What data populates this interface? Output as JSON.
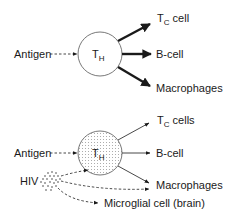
{
  "diagrams": [
    {
      "name": "normal",
      "center_label": "T",
      "center_sub": "H",
      "input_label": "Antigen",
      "outputs": [
        {
          "main": "T",
          "sub": "C",
          "rest": " cell"
        },
        {
          "main": "B-cell"
        },
        {
          "main": "Macrophages"
        }
      ]
    },
    {
      "name": "hiv-infected",
      "center_label": "T",
      "center_sub": "H",
      "input_label": "Antigen",
      "virus_label": "HIV",
      "outputs": [
        {
          "main": "T",
          "sub": "C",
          "rest": " cells"
        },
        {
          "main": "B-cell"
        },
        {
          "main": "Macrophages"
        }
      ],
      "extra_target": "Microglial cell (brain)"
    }
  ],
  "colors": {
    "ink": "#1a1a1a",
    "stipple": "#555555"
  }
}
